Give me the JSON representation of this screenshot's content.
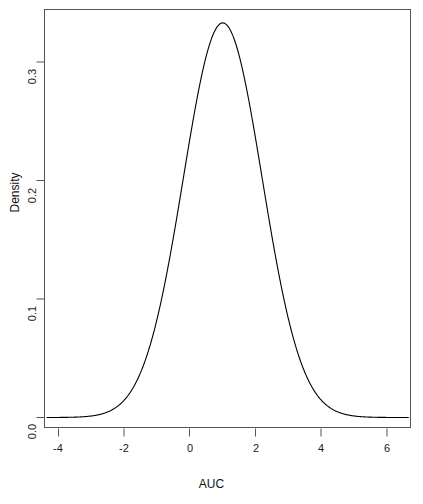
{
  "chart_data": {
    "type": "line",
    "title": "",
    "xlabel": "AUC",
    "ylabel": "Density",
    "xlim": [
      -4.35,
      6.65
    ],
    "ylim": [
      0.0,
      0.3535
    ],
    "grid": false,
    "legend": "none",
    "xticks": [
      -4,
      -2,
      0,
      2,
      4,
      6
    ],
    "xtick_labels": [
      "-4",
      "-2",
      "0",
      "2",
      "4",
      "6"
    ],
    "yticks": [
      0.0,
      0.1,
      0.2,
      0.3
    ],
    "ytick_labels": [
      "0.0",
      "0.1",
      "0.2",
      "0.3"
    ],
    "series": [
      {
        "name": "Density of AUC",
        "peak_x": 0.98,
        "peak_y": 0.333,
        "mean": 1.0,
        "sd": 1.2,
        "x": [
          -4.35,
          -4.1,
          -3.85,
          -3.6,
          -3.35,
          -3.1,
          -2.85,
          -2.6,
          -2.35,
          -2.1,
          -1.85,
          -1.6,
          -1.35,
          -1.1,
          -0.85,
          -0.6,
          -0.35,
          -0.1,
          0.15,
          0.4,
          0.65,
          0.9,
          0.98,
          1.15,
          1.4,
          1.65,
          1.9,
          2.15,
          2.4,
          2.65,
          2.9,
          3.15,
          3.4,
          3.65,
          3.9,
          4.15,
          4.4,
          4.65,
          4.9,
          5.15,
          5.4,
          5.65,
          5.9,
          6.15,
          6.4,
          6.65
        ],
        "y": [
          0.0,
          0.0001,
          0.0002,
          0.0004,
          0.0008,
          0.0015,
          0.0026,
          0.0045,
          0.0075,
          0.0119,
          0.0182,
          0.0268,
          0.0379,
          0.0517,
          0.068,
          0.0863,
          0.1056,
          0.1248,
          0.1427,
          0.158,
          0.1696,
          0.1767,
          0.1775,
          0.1762,
          0.1715,
          0.1601,
          0.1448,
          0.1267,
          0.1072,
          0.0876,
          0.0691,
          0.0526,
          0.0387,
          0.0275,
          0.0188,
          0.0125,
          0.008,
          0.0049,
          0.0029,
          0.0017,
          0.001,
          0.0005,
          0.0003,
          0.0002,
          0.0001,
          0.0
        ]
      }
    ]
  },
  "axes": {
    "x_title": "AUC",
    "y_title": "Density",
    "x_tick_labels": [
      "-4",
      "-2",
      "0",
      "2",
      "4",
      "6"
    ],
    "y_tick_labels": [
      "0.0",
      "0.1",
      "0.2",
      "0.3"
    ]
  },
  "colors": {
    "curve": "#000000",
    "frame": "#555555",
    "background": "#ffffff",
    "text": "#111111"
  }
}
